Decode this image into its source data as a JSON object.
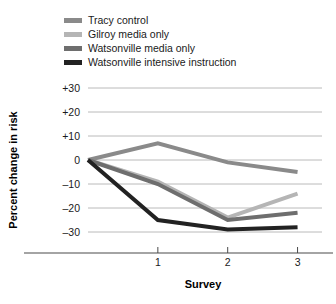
{
  "chart_data": {
    "type": "line",
    "title": "",
    "xlabel": "Survey",
    "ylabel": "Percent change in risk",
    "x": [
      0,
      1,
      2,
      3
    ],
    "x_tick_positions": [
      1,
      2,
      3
    ],
    "x_tick_labels": [
      "1",
      "2",
      "3"
    ],
    "xlim": [
      0,
      3.35
    ],
    "ylim": [
      -30,
      30
    ],
    "y_ticks": [
      30,
      20,
      10,
      0,
      -10,
      -20,
      -30
    ],
    "y_tick_labels": [
      "+30",
      "+20",
      "+10",
      "0",
      "–10",
      "–20",
      "–30"
    ],
    "grid": true,
    "grid_axis": "y",
    "legend_position": "top-left",
    "series": [
      {
        "name": "Tracy control",
        "color": "#8a8a8a",
        "values": [
          0,
          7,
          -1,
          -5
        ]
      },
      {
        "name": "Gilroy media only",
        "color": "#b5b5b5",
        "values": [
          0,
          -9,
          -24,
          -14
        ]
      },
      {
        "name": "Watsonville media only",
        "color": "#6e6e6e",
        "values": [
          0,
          -10,
          -25,
          -22
        ]
      },
      {
        "name": "Watsonville intensive instruction",
        "color": "#222222",
        "values": [
          0,
          -25,
          -29,
          -28
        ]
      }
    ]
  },
  "legend": {
    "items": [
      {
        "label": "Tracy control",
        "color": "#8a8a8a"
      },
      {
        "label": "Gilroy media only",
        "color": "#b5b5b5"
      },
      {
        "label": "Watsonville media only",
        "color": "#6e6e6e"
      },
      {
        "label": "Watsonville intensive instruction",
        "color": "#222222"
      }
    ]
  },
  "axes": {
    "x_title": "Survey",
    "y_title": "Percent change in risk",
    "y_tick_labels": [
      "+30",
      "+20",
      "+10",
      "0",
      "–10",
      "–20",
      "–30"
    ],
    "x_tick_labels": [
      "1",
      "2",
      "3"
    ]
  }
}
